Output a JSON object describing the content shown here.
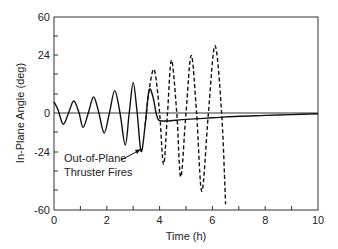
{
  "chart_data": {
    "type": "line",
    "title": "",
    "xlabel": "Time (h)",
    "ylabel": "In-Plane Angle (deg)",
    "xlim": [
      0,
      10
    ],
    "ylim": [
      -60,
      60
    ],
    "x_ticks": [
      0,
      2,
      4,
      6,
      8,
      10
    ],
    "x_minor_ticks": [
      1,
      3,
      5,
      7,
      9
    ],
    "y_tick_labels": [
      "60",
      "24",
      "0",
      "-24",
      "-60"
    ],
    "grid": false,
    "legend": null,
    "annotations": [
      {
        "text_lines": [
          "Out-of-Plane",
          "Thruster Fires"
        ],
        "arrow_to": {
          "x": 3.3,
          "y": -24
        }
      }
    ],
    "series": [
      {
        "name": "solid (with out-of-plane thruster firing)",
        "style": "solid",
        "x": [
          0,
          0.15,
          0.35,
          0.55,
          0.75,
          0.95,
          1.1,
          1.3,
          1.5,
          1.7,
          1.9,
          2.1,
          2.3,
          2.5,
          2.7,
          2.85,
          3.0,
          3.15,
          3.3,
          3.45,
          3.6,
          3.75,
          3.9,
          4.1,
          5,
          6,
          7,
          8,
          9,
          10
        ],
        "y": [
          7,
          2,
          -7,
          0,
          7.5,
          0,
          -9,
          0,
          10,
          0,
          -12.5,
          0,
          14,
          0,
          -20,
          0,
          19,
          0,
          -24,
          -8,
          14,
          10,
          -2,
          -5,
          -4,
          -3,
          -2,
          -1.5,
          -1,
          -0.5
        ]
      },
      {
        "name": "dashed (unstable growth)",
        "style": "dashed",
        "x": [
          3.45,
          3.6,
          3.8,
          4.0,
          4.15,
          4.3,
          4.45,
          4.65,
          4.8,
          5.0,
          5.2,
          5.4,
          5.6,
          5.85,
          6.1,
          6.35,
          6.5
        ],
        "y": [
          -8,
          14,
          27,
          0,
          -32,
          0,
          33,
          0,
          -40,
          0,
          36,
          0,
          -49,
          0,
          42,
          0,
          -57
        ]
      }
    ]
  },
  "axes": {
    "xlabel": "Time (h)",
    "ylabel": "In-Plane Angle (deg)",
    "x_tick_labels": [
      "0",
      "2",
      "4",
      "6",
      "8",
      "10"
    ],
    "y_tick_labels": [
      "60",
      "24",
      "0",
      "-24",
      "-60"
    ]
  },
  "annotation": {
    "line1": "Out-of-Plane",
    "line2": "Thruster Fires"
  }
}
